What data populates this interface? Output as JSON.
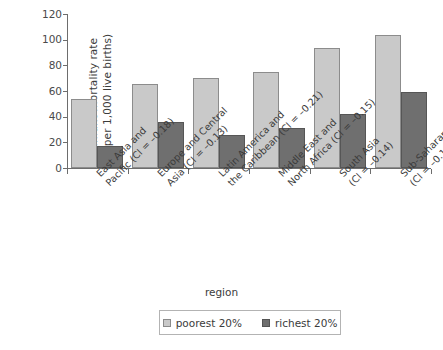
{
  "chart_data": {
    "type": "bar",
    "title": "",
    "xlabel": "region",
    "ylabel": "infant mortality rate\n(per 1,000 live births)",
    "ylabel_line1": "infant mortality rate",
    "ylabel_line2": "(per 1,000 live births)",
    "ylim": [
      0,
      120
    ],
    "yticks": [
      0,
      20,
      40,
      60,
      80,
      100,
      120
    ],
    "ytick_labels": [
      "0",
      "20",
      "40",
      "60",
      "80",
      "100",
      "120"
    ],
    "grid": false,
    "legend_position": "bottom",
    "categories": [
      "East Asia and Pacific (CI = –0.18)",
      "Europe and Central Asia (CI = –0.13)",
      "Latin America and the Caribbean (CI = –0.21)",
      "Middle East and North Africa (CI = –0.15)",
      "South Asia (CI = –0.14)",
      "Sub-Saharan Africa (CI = –0.10)"
    ],
    "category_lines": [
      {
        "l1": "East Asia and",
        "l2": "Pacific (CI = –0.18)"
      },
      {
        "l1": "Europe and Central",
        "l2": "Asia (CI = –0.13)"
      },
      {
        "l1": "Latin America and",
        "l2": "the Caribbean (CI = –0.21)"
      },
      {
        "l1": "Middle East and",
        "l2": "North Africa (CI = –0.15)"
      },
      {
        "l1": "South Asia",
        "l2": "(CI = –0.14)"
      },
      {
        "l1": "Sub-Saharan Africa",
        "l2": "(CI = –0.10)"
      }
    ],
    "series": [
      {
        "name": "poorest 20%",
        "color": "#c9c9c9",
        "values": [
          54,
          65.5,
          70.5,
          75,
          93.5,
          103.5
        ]
      },
      {
        "name": "richest 20%",
        "color": "#6f6f6f",
        "values": [
          17.5,
          35.5,
          26,
          31.5,
          42,
          59.5
        ]
      }
    ]
  },
  "legend": {
    "entries": [
      {
        "label": "poorest 20%",
        "color": "#c9c9c9"
      },
      {
        "label": "richest 20%",
        "color": "#6f6f6f"
      }
    ]
  },
  "axis": {
    "x_title": "region",
    "y_title_line1": "infant mortality rate",
    "y_title_line2": "(per 1,000 live births)"
  },
  "colors": {
    "poorest": "#c9c9c9",
    "richest": "#6f6f6f",
    "axis": "#6d6d6d",
    "text": "#3b3b3b",
    "background": "#ffffff"
  }
}
